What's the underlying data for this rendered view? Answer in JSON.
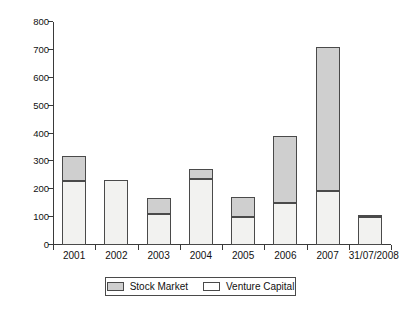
{
  "chart_data": {
    "type": "bar",
    "title": "",
    "subtitle": "",
    "xlabel": "",
    "ylabel": "",
    "stacked": true,
    "grid": false,
    "legend_position": "bottom",
    "ylim": [
      0,
      800
    ],
    "ytick_step": 100,
    "ytick_labels": [
      "0",
      "100",
      "200",
      "300",
      "400",
      "500",
      "600",
      "700",
      "800"
    ],
    "ytick_values": [
      0,
      100,
      200,
      300,
      400,
      500,
      600,
      700,
      800
    ],
    "categories": [
      "2001",
      "2002",
      "2003",
      "2004",
      "2005",
      "2006",
      "2007",
      "31/07/2008"
    ],
    "series": [
      {
        "name": "Venture Capital",
        "color": "#f2f2f0",
        "values": [
          228,
          232,
          110,
          237,
          102,
          150,
          195,
          100
        ]
      },
      {
        "name": "Stock Market",
        "color": "#cfcfcf",
        "values": [
          92,
          0,
          60,
          35,
          70,
          240,
          515,
          5
        ]
      }
    ],
    "totals": [
      320,
      232,
      170,
      272,
      172,
      390,
      710,
      105
    ]
  },
  "legend": {
    "items": [
      {
        "label": "Stock Market",
        "swatch": "stock"
      },
      {
        "label": "Venture Capital",
        "swatch": "venture"
      }
    ]
  },
  "colors": {
    "stock_market": "#cfcfcf",
    "venture_capital": "#f2f2f0",
    "axis": "#3a3a3a",
    "bar_border": "#4a4a4a",
    "background": "#ffffff"
  }
}
